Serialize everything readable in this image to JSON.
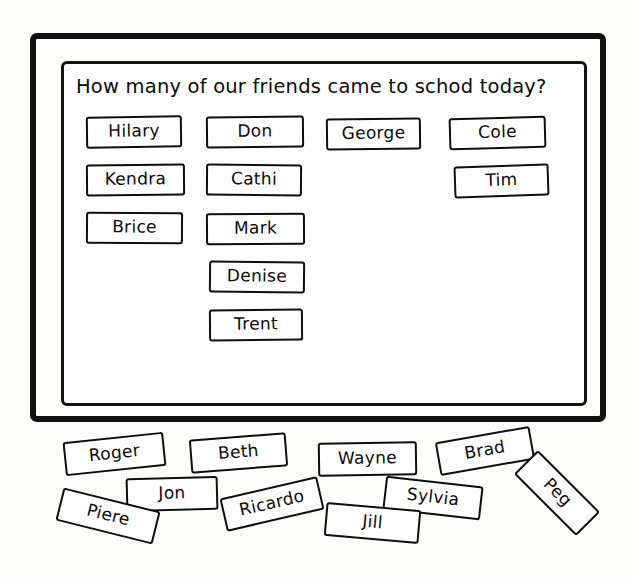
{
  "board": {
    "title": "How many of our friends came to schod today?",
    "columns": [
      {
        "name": "column-1",
        "cards": [
          {
            "label": "Hilary",
            "x": 80,
            "y": 110,
            "w": 96,
            "rot": -0.8
          },
          {
            "label": "Kendra",
            "x": 80,
            "y": 158,
            "w": 99,
            "rot": -0.5
          },
          {
            "label": "Brice",
            "x": 80,
            "y": 206,
            "w": 97,
            "rot": 0.4
          }
        ]
      },
      {
        "name": "column-2",
        "cards": [
          {
            "label": "Don",
            "x": 200,
            "y": 110,
            "w": 98,
            "rot": -0.6
          },
          {
            "label": "Cathi",
            "x": 200,
            "y": 158,
            "w": 96,
            "rot": 0.5
          },
          {
            "label": "Mark",
            "x": 200,
            "y": 207,
            "w": 99,
            "rot": -0.4
          },
          {
            "label": "Denise",
            "x": 203,
            "y": 255,
            "w": 96,
            "rot": 0.6
          },
          {
            "label": "Trent",
            "x": 203,
            "y": 303,
            "w": 94,
            "rot": -0.5
          }
        ]
      },
      {
        "name": "column-3",
        "cards": [
          {
            "label": "George",
            "x": 320,
            "y": 112,
            "w": 95,
            "rot": -0.7
          }
        ]
      },
      {
        "name": "column-4",
        "cards": [
          {
            "label": "Cole",
            "x": 443,
            "y": 111,
            "w": 97,
            "rot": -1.6
          },
          {
            "label": "Tim",
            "x": 448,
            "y": 159,
            "w": 95,
            "rot": -1.9
          }
        ]
      }
    ]
  },
  "loose_cards": [
    {
      "label": "Roger",
      "x": 64,
      "y": 437,
      "w": 101,
      "rot": -6
    },
    {
      "label": "Beth",
      "x": 190,
      "y": 436,
      "w": 97,
      "rot": -4.5
    },
    {
      "label": "Wayne",
      "x": 318,
      "y": 442,
      "w": 99,
      "rot": -0.8
    },
    {
      "label": "Brad",
      "x": 437,
      "y": 434,
      "w": 96,
      "rot": -10
    },
    {
      "label": "Jon",
      "x": 126,
      "y": 477,
      "w": 92,
      "rot": -1.5
    },
    {
      "label": "Ricardo",
      "x": 222,
      "y": 487,
      "w": 100,
      "rot": -13
    },
    {
      "label": "Sylvia",
      "x": 384,
      "y": 481,
      "w": 98,
      "rot": 6.5
    },
    {
      "label": "Piere",
      "x": 58,
      "y": 499,
      "w": 100,
      "rot": 14
    },
    {
      "label": "Jill",
      "x": 325,
      "y": 506,
      "w": 95,
      "rot": 5
    },
    {
      "label": "Peg",
      "x": 513,
      "y": 476,
      "w": 88,
      "rot": 45
    }
  ]
}
